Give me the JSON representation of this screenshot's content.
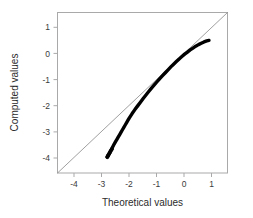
{
  "chart_data": {
    "type": "scatter",
    "title": "",
    "subtitle": "",
    "xlabel": "Theoretical values",
    "ylabel": "Computed values",
    "xlim": [
      -4.6,
      1.55
    ],
    "ylim": [
      -4.55,
      1.5
    ],
    "xticks": [
      -4,
      -3,
      -2,
      -1,
      0,
      1
    ],
    "xticklabels": [
      "-4",
      "-3",
      "-2",
      "-1",
      "0",
      "1"
    ],
    "yticks": [
      -4,
      -3,
      -2,
      -1,
      0,
      1
    ],
    "yticklabels": [
      "-4",
      "-3",
      "-2",
      "-1",
      "0",
      "1"
    ],
    "grid": false,
    "legend": null,
    "annotations": [],
    "series": [
      {
        "name": "reference-line",
        "type": "line",
        "style": "thin gray diagonal y = x spanning plot corners",
        "color": "#777777",
        "x": [
          -4.6,
          1.55
        ],
        "y": [
          -4.55,
          1.5
        ]
      },
      {
        "name": "computed-vs-theoretical",
        "type": "scatter",
        "style": "dense overlapping open circles forming thick black curve",
        "color": "#000000",
        "x": [
          -2.8,
          -2.76,
          -2.72,
          -2.68,
          -2.64,
          -2.6,
          -2.55,
          -2.5,
          -2.45,
          -2.4,
          -2.35,
          -2.3,
          -2.25,
          -2.2,
          -2.15,
          -2.1,
          -2.05,
          -2.0,
          -1.9,
          -1.8,
          -1.7,
          -1.6,
          -1.5,
          -1.4,
          -1.3,
          -1.2,
          -1.1,
          -1.0,
          -0.9,
          -0.8,
          -0.7,
          -0.6,
          -0.5,
          -0.4,
          -0.3,
          -0.2,
          -0.1,
          0.0,
          0.1,
          0.2,
          0.3,
          0.4,
          0.5,
          0.6,
          0.7,
          0.8,
          0.88
        ],
        "y": [
          -3.95,
          -3.88,
          -3.8,
          -3.72,
          -3.64,
          -3.56,
          -3.46,
          -3.37,
          -3.28,
          -3.19,
          -3.1,
          -3.01,
          -2.92,
          -2.83,
          -2.74,
          -2.65,
          -2.56,
          -2.47,
          -2.31,
          -2.16,
          -2.02,
          -1.88,
          -1.74,
          -1.61,
          -1.48,
          -1.35,
          -1.23,
          -1.11,
          -0.99,
          -0.88,
          -0.77,
          -0.66,
          -0.55,
          -0.45,
          -0.35,
          -0.25,
          -0.16,
          -0.07,
          0.01,
          0.09,
          0.16,
          0.23,
          0.29,
          0.34,
          0.39,
          0.43,
          0.45
        ]
      }
    ],
    "tail_markers": {
      "description": "individually resolvable open circles at lower-left tail",
      "x": [
        -2.8,
        -2.78,
        -2.76,
        -2.73,
        -2.7,
        -2.67,
        -2.63
      ],
      "y": [
        -3.95,
        -3.91,
        -3.87,
        -3.82,
        -3.77,
        -3.71,
        -3.65
      ]
    }
  },
  "axes": {
    "x_title": "Theoretical values",
    "y_title": "Computed values",
    "x_tick_labels": [
      "-4",
      "-3",
      "-2",
      "-1",
      "0",
      "1"
    ],
    "y_tick_labels": [
      "1",
      "0",
      "-1",
      "-2",
      "-3",
      "-4"
    ]
  },
  "colors": {
    "data": "#000000",
    "reference": "#777777",
    "frame": "#a9a9a9",
    "text": "#2b2b2b",
    "background": "#ffffff"
  }
}
